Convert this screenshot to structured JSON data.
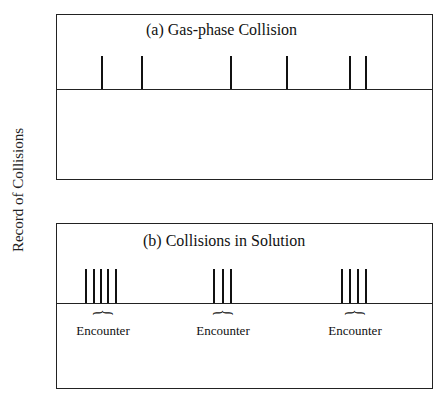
{
  "y_axis_label": "Record of Collisions",
  "panels": {
    "a": {
      "title": "(a) Gas-phase Collision",
      "tick_x": [
        45,
        85,
        174,
        230,
        293,
        309
      ]
    },
    "b": {
      "title": "(b) Collisions in Solution",
      "groups": [
        {
          "ticks": [
            29,
            37,
            44,
            51,
            59
          ],
          "label": "Encounter",
          "center": 46
        },
        {
          "ticks": [
            157,
            166,
            174
          ],
          "label": "Encounter",
          "center": 166
        },
        {
          "ticks": [
            285,
            293,
            301,
            309
          ],
          "label": "Encounter",
          "center": 298
        }
      ]
    }
  },
  "brace_glyph": "}"
}
